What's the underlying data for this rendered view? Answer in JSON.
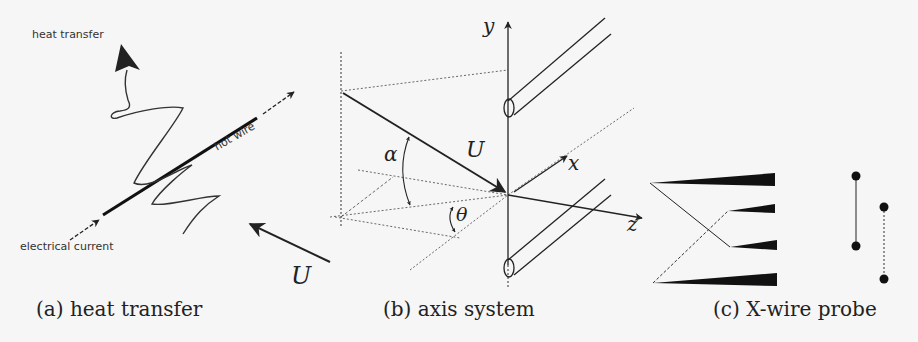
{
  "figure": {
    "background": "#f6f6f6",
    "ink": "#222222",
    "panels": [
      {
        "id": "a",
        "caption": "(a) heat transfer",
        "labels": {
          "heat_transfer": "heat transfer",
          "hot_wire": "hot wire",
          "electrical_current": "electrical current",
          "velocity": "U"
        }
      },
      {
        "id": "b",
        "caption": "(b) axis system",
        "labels": {
          "y_axis": "y",
          "x_axis": "x",
          "z_axis": "z",
          "velocity": "U",
          "alpha": "α",
          "theta": "θ"
        }
      },
      {
        "id": "c",
        "caption": "(c) X-wire probe"
      }
    ]
  }
}
